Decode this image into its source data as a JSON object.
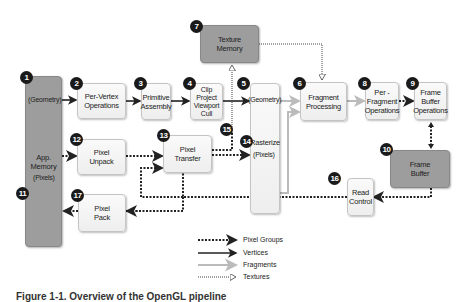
{
  "diagram": {
    "type": "OpenGL rendering pipeline",
    "nodes": [
      {
        "id": 1,
        "label": "App.\nMemory",
        "style": "dark"
      },
      {
        "id": 2,
        "label": "Per-Vertex\nOperations",
        "style": "light"
      },
      {
        "id": 3,
        "label": "Primitive\nAssembly",
        "style": "light"
      },
      {
        "id": 4,
        "label": "Clip\nProject\nViewport\nCull",
        "style": "light"
      },
      {
        "id": 5,
        "label": "Rasterize",
        "style": "light"
      },
      {
        "id": 6,
        "label": "Fragment\nProcessing",
        "style": "light"
      },
      {
        "id": 7,
        "label": "Texture\nMemory",
        "style": "dark"
      },
      {
        "id": 8,
        "label": "Per -\nFragment\nOperations",
        "style": "light"
      },
      {
        "id": 9,
        "label": "Frame\nBuffer\nOperations",
        "style": "light"
      },
      {
        "id": 10,
        "label": "Frame\nBuffer",
        "style": "dark"
      },
      {
        "id": 12,
        "label": "Pixel\nUnpack",
        "style": "light"
      },
      {
        "id": 13,
        "label": "Pixel\nTransfer",
        "style": "light"
      },
      {
        "id": 16,
        "label": "Read\nControl",
        "style": "light"
      },
      {
        "id": 17,
        "label": "Pixel\nPack",
        "style": "light"
      }
    ],
    "badges": [
      "1",
      "2",
      "3",
      "4",
      "5",
      "6",
      "7",
      "8",
      "9",
      "10",
      "11",
      "12",
      "13",
      "14",
      "15",
      "16",
      "17"
    ],
    "sublabels": {
      "app_geometry": "(Geometry)",
      "app_pixels": "(Pixels)",
      "raster_geometry": "(Geometry)",
      "raster_pixels": "(Pixels)"
    },
    "legend": [
      {
        "label": "Pixel Groups",
        "style": "thick-dotted"
      },
      {
        "label": "Vertices",
        "style": "solid-dark"
      },
      {
        "label": "Fragments",
        "style": "solid-gray"
      },
      {
        "label": "Textures",
        "style": "thin-dotted-hollow"
      }
    ],
    "colors": {
      "dark_box": "#9d9d9d",
      "light_box": "#f4f4f4",
      "badge": "#1a1a1a",
      "vertices": "#222222",
      "fragments": "#bbbbbb"
    },
    "caption": "Figure 1-1. Overview of the OpenGL pipeline"
  }
}
